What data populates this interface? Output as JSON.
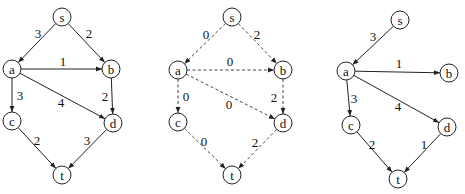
{
  "node_radius": 9,
  "graphs": [
    {
      "name": "original-graph",
      "style": "solid",
      "nodes": [
        {
          "id": "s",
          "label": "s",
          "x": 62,
          "y": 17
        },
        {
          "id": "a",
          "label": "a",
          "x": 12,
          "y": 69
        },
        {
          "id": "b",
          "label": "b",
          "x": 111,
          "y": 69
        },
        {
          "id": "c",
          "label": "c",
          "x": 12,
          "y": 121
        },
        {
          "id": "d",
          "label": "d",
          "x": 113,
          "y": 123
        },
        {
          "id": "t",
          "label": "t",
          "x": 62,
          "y": 175
        }
      ],
      "edges": [
        {
          "from": "s",
          "to": "a",
          "weight": "3",
          "lx": 38,
          "ly": 33
        },
        {
          "from": "s",
          "to": "b",
          "weight": "2",
          "lx": 89,
          "ly": 33
        },
        {
          "from": "a",
          "to": "b",
          "weight": "1",
          "lx": 63,
          "ly": 61
        },
        {
          "from": "a",
          "to": "c",
          "weight": "3",
          "lx": 20,
          "ly": 95
        },
        {
          "from": "a",
          "to": "d",
          "weight": "4",
          "lx": 61,
          "ly": 102
        },
        {
          "from": "b",
          "to": "d",
          "weight": "2",
          "lx": 105,
          "ly": 96
        },
        {
          "from": "c",
          "to": "t",
          "weight": "2",
          "lx": 37,
          "ly": 140
        },
        {
          "from": "d",
          "to": "t",
          "weight": "3",
          "lx": 87,
          "ly": 140
        }
      ]
    },
    {
      "name": "reduced-cost-graph",
      "style": "dashed",
      "nodes": [
        {
          "id": "s",
          "label": "s",
          "x": 232,
          "y": 17
        },
        {
          "id": "a",
          "label": "a",
          "x": 178,
          "y": 70
        },
        {
          "id": "b",
          "label": "b",
          "x": 283,
          "y": 70
        },
        {
          "id": "c",
          "label": "c",
          "x": 178,
          "y": 122
        },
        {
          "id": "d",
          "label": "d",
          "x": 283,
          "y": 123
        },
        {
          "id": "t",
          "label": "t",
          "x": 232,
          "y": 175
        }
      ],
      "edges": [
        {
          "from": "s",
          "to": "a",
          "weight": "0",
          "lx": 206,
          "ly": 34
        },
        {
          "from": "s",
          "to": "b",
          "weight": "2",
          "lx": 257,
          "ly": 34
        },
        {
          "from": "a",
          "to": "b",
          "weight": "0",
          "lx": 230,
          "ly": 61
        },
        {
          "from": "a",
          "to": "c",
          "weight": "0",
          "lx": 186,
          "ly": 96
        },
        {
          "from": "a",
          "to": "d",
          "weight": "0",
          "lx": 229,
          "ly": 104
        },
        {
          "from": "b",
          "to": "d",
          "weight": "2",
          "lx": 274,
          "ly": 97
        },
        {
          "from": "c",
          "to": "t",
          "weight": "0",
          "lx": 204,
          "ly": 141
        },
        {
          "from": "d",
          "to": "t",
          "weight": "2",
          "lx": 255,
          "ly": 142
        }
      ]
    },
    {
      "name": "shortest-path-tree",
      "style": "solid",
      "nodes": [
        {
          "id": "s",
          "label": "s",
          "x": 400,
          "y": 20
        },
        {
          "id": "a",
          "label": "a",
          "x": 346,
          "y": 71
        },
        {
          "id": "b",
          "label": "b",
          "x": 449,
          "y": 73
        },
        {
          "id": "c",
          "label": "c",
          "x": 351,
          "y": 125
        },
        {
          "id": "d",
          "label": "d",
          "x": 447,
          "y": 127
        },
        {
          "id": "t",
          "label": "t",
          "x": 398,
          "y": 179
        }
      ],
      "edges": [
        {
          "from": "s",
          "to": "a",
          "weight": "3",
          "lx": 373,
          "ly": 36
        },
        {
          "from": "a",
          "to": "b",
          "weight": "1",
          "lx": 399,
          "ly": 63
        },
        {
          "from": "a",
          "to": "c",
          "weight": "3",
          "lx": 354,
          "ly": 98
        },
        {
          "from": "a",
          "to": "d",
          "weight": "4",
          "lx": 398,
          "ly": 106
        },
        {
          "from": "c",
          "to": "t",
          "weight": "2",
          "lx": 372,
          "ly": 144
        },
        {
          "from": "d",
          "to": "t",
          "weight": "1",
          "lx": 424,
          "ly": 144
        }
      ]
    }
  ]
}
